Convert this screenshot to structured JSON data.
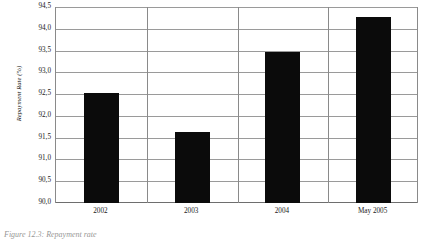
{
  "chart_data": {
    "type": "bar",
    "title": "",
    "xlabel": "",
    "ylabel": "Repayment Rate (%)",
    "categories": [
      "2002",
      "2003",
      "2004",
      "May 2005"
    ],
    "values": [
      92.55,
      91.65,
      93.5,
      94.3
    ],
    "ylim": [
      90.0,
      94.5
    ],
    "ytick_labels": [
      "94,5",
      "94,0",
      "93,5",
      "93,0",
      "92,5",
      "92,0",
      "91,5",
      "91,0",
      "90,5",
      "90,0"
    ],
    "ytick_values": [
      94.5,
      94.0,
      93.5,
      93.0,
      92.5,
      92.0,
      91.5,
      91.0,
      90.5,
      90.0
    ],
    "grid": true,
    "legend": false,
    "legend_position": "none",
    "bar_color": "#0b0b0b",
    "gridline_color": "#9a9a9a"
  },
  "axes": {
    "y_title": "Repayment Rate (%)"
  },
  "caption": {
    "text": "Figure 12.3: Repayment rate"
  }
}
